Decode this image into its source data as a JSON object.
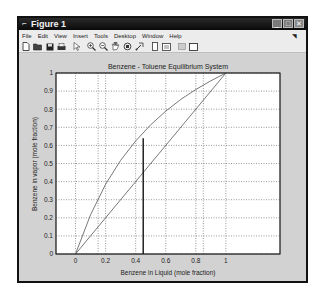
{
  "window": {
    "title": "Figure 1",
    "controls": [
      "minimize",
      "maximize",
      "close"
    ]
  },
  "menubar": {
    "items": [
      "File",
      "Edit",
      "View",
      "Insert",
      "Tools",
      "Desktop",
      "Window",
      "Help"
    ]
  },
  "toolbar": {
    "icons": [
      "new-figure-icon",
      "open-file-icon",
      "save-icon",
      "print-icon",
      "edit-plot-arrow-icon",
      "zoom-in-icon",
      "zoom-out-icon",
      "pan-hand-icon",
      "rotate-3d-icon",
      "data-cursor-icon",
      "colorbar-icon",
      "legend-icon",
      "hide-plot-tools-icon",
      "show-plot-tools-icon"
    ]
  },
  "chart_data": {
    "type": "line",
    "title": "Benzene - Toluene Equilibrium System",
    "xlabel": "Benzene in Liquid (mole fraction)",
    "ylabel": "Benzene in vapor (mole fraction)",
    "xlim": [
      -0.13,
      1.36
    ],
    "ylim": [
      0,
      1
    ],
    "xticks": [
      "0",
      "0.2",
      "0.4",
      "0.6",
      "0.8",
      "1"
    ],
    "yticks": [
      "0",
      "0.1",
      "0.2",
      "0.3",
      "0.4",
      "0.5",
      "0.6",
      "0.7",
      "0.8",
      "0.9",
      "1"
    ],
    "grid": true,
    "extra_vertical_gridlines": [
      0.15,
      0.85
    ],
    "series": [
      {
        "name": "equilibrium curve",
        "x": [
          0,
          0.1,
          0.2,
          0.3,
          0.4,
          0.5,
          0.6,
          0.7,
          0.8,
          0.9,
          1.0
        ],
        "y": [
          0,
          0.217,
          0.385,
          0.517,
          0.625,
          0.714,
          0.789,
          0.854,
          0.909,
          0.957,
          1.0
        ],
        "color": "#555555"
      },
      {
        "name": "y = x diagonal",
        "x": [
          0,
          1
        ],
        "y": [
          0,
          1
        ],
        "color": "#555555"
      },
      {
        "name": "vertical marker",
        "x": [
          0.45,
          0.45
        ],
        "y": [
          0,
          0.64
        ],
        "color": "#000000"
      }
    ]
  }
}
